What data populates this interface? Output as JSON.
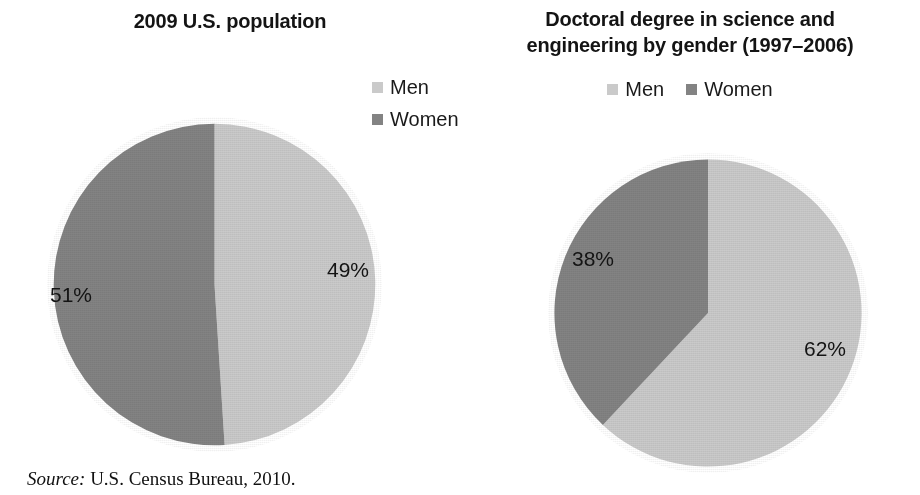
{
  "figure": {
    "source_note_label": "Source:",
    "source_note_text": " U.S. Census Bureau, 2010."
  },
  "colors": {
    "men": "#cacaca",
    "women": "#838383",
    "text": "#141414",
    "background": "#ffffff"
  },
  "charts": {
    "left": {
      "title_line1": "2009 U.S. population",
      "legend": [
        {
          "label": "Men",
          "color": "#cacaca"
        },
        {
          "label": "Women",
          "color": "#838383"
        }
      ],
      "labels": {
        "men": "49%",
        "women": "51%"
      }
    },
    "right": {
      "title_line1": "Doctoral degree in science and",
      "title_line2": "engineering by gender (1997–2006)",
      "legend": [
        {
          "label": "Men",
          "color": "#cacaca"
        },
        {
          "label": "Women",
          "color": "#838383"
        }
      ],
      "labels": {
        "men": "62%",
        "women": "38%"
      }
    }
  },
  "chart_data": [
    {
      "type": "pie",
      "title": "2009 U.S. population",
      "categories": [
        "Men",
        "Women"
      ],
      "values": [
        49,
        51
      ],
      "data_labels": [
        "49%",
        "51%"
      ],
      "colors": [
        "#cacaca",
        "#838383"
      ],
      "units": "percent",
      "start_angle_deg": 0,
      "direction": "clockwise",
      "legend_position": "top-right",
      "grid": false,
      "xlabel": "",
      "ylabel": "",
      "source": "U.S. Census Bureau, 2010."
    },
    {
      "type": "pie",
      "title": "Doctoral degree in science and engineering by gender (1997–2006)",
      "categories": [
        "Men",
        "Women"
      ],
      "values": [
        62,
        38
      ],
      "data_labels": [
        "62%",
        "38%"
      ],
      "colors": [
        "#cacaca",
        "#838383"
      ],
      "units": "percent",
      "start_angle_deg": 0,
      "direction": "clockwise",
      "legend_position": "top-center",
      "grid": false,
      "xlabel": "",
      "ylabel": "",
      "source": "U.S. Census Bureau, 2010."
    }
  ]
}
